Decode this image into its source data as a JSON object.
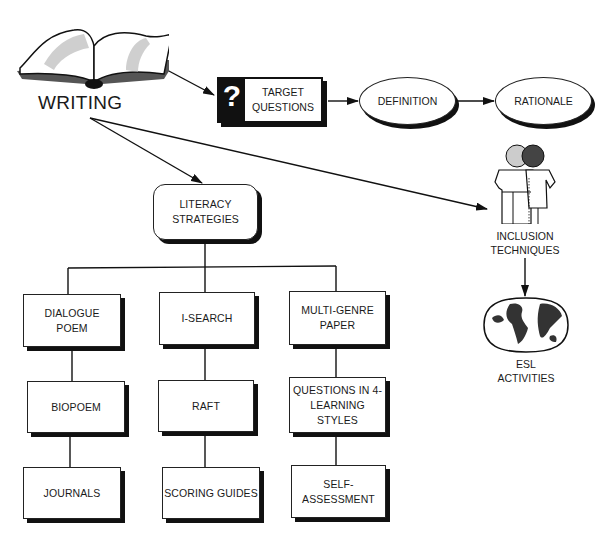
{
  "root": {
    "label": "WRITING",
    "icon": "open-book-icon"
  },
  "top_chain": {
    "target_questions": {
      "label": "TARGET\nQUESTIONS",
      "icon_glyph": "?",
      "icon": "question-mark-icon"
    },
    "definition": {
      "label": "DEFINITION"
    },
    "rationale": {
      "label": "RATIONALE"
    }
  },
  "inclusion": {
    "label": "INCLUSION\nTECHNIQUES",
    "icon": "two-people-icon"
  },
  "esl": {
    "label": "ESL\nACTIVITIES",
    "icon": "world-map-icon"
  },
  "literacy": {
    "label": "LITERACY\nSTRATEGIES"
  },
  "columns": [
    {
      "items": [
        "DIALOGUE\nPOEM",
        "BIOPOEM",
        "JOURNALS"
      ]
    },
    {
      "items": [
        "I-SEARCH",
        "RAFT",
        "SCORING GUIDES"
      ]
    },
    {
      "items": [
        "MULTI-GENRE\nPAPER",
        "QUESTIONS IN 4-\nLEARNING\nSTYLES",
        "SELF-\nASSESSMENT"
      ]
    }
  ],
  "colors": {
    "ink": "#111111",
    "background": "#ffffff",
    "tone": "#9a9a9a"
  }
}
